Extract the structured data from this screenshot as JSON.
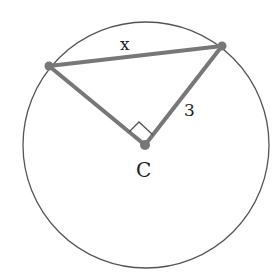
{
  "diagram": {
    "type": "geometry-circle",
    "circle": {
      "cx": 146,
      "cy": 145,
      "r": 124,
      "stroke": "#555555"
    },
    "center": {
      "x": 145,
      "y": 145,
      "label": "C"
    },
    "points": {
      "left": {
        "x": 49,
        "y": 66
      },
      "right": {
        "x": 222,
        "y": 46
      }
    },
    "segment_color": "#777777",
    "labels": {
      "chord": "x",
      "radius": "3",
      "center": "C"
    },
    "right_angle_at": "C"
  }
}
